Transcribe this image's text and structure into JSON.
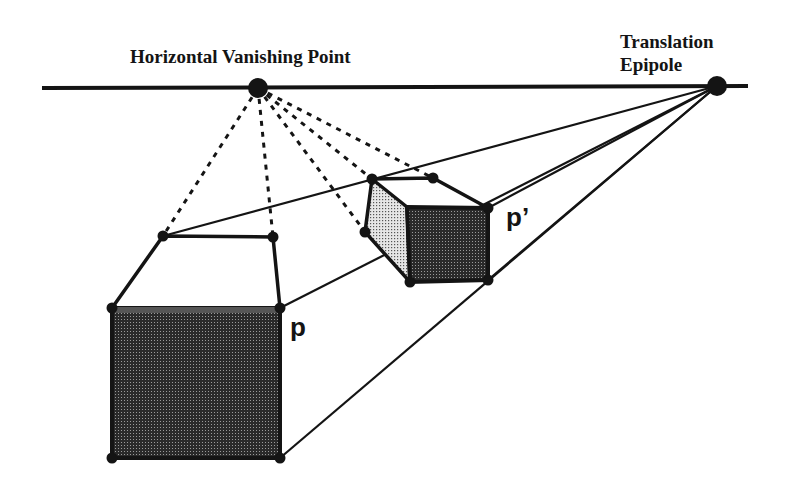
{
  "labels": {
    "vanishing_point": "Horizontal Vanishing Point",
    "epipole_line1": "Translation",
    "epipole_line2": "Epipole",
    "point_p": "p",
    "point_p_prime": "p’"
  },
  "colors": {
    "ink": "#141414",
    "dark_fill": "#3a3a3a",
    "light_fill": "#c8c8c8",
    "background": "#ffffff"
  },
  "geometry": {
    "horizon": {
      "x1": 42,
      "y1": 88,
      "x2": 748,
      "y2": 86
    },
    "vanishing_point": {
      "x": 258,
      "y": 88
    },
    "epipole": {
      "x": 717,
      "y": 86
    },
    "large_box": {
      "front_face": {
        "x": 112,
        "y": 308,
        "w": 168,
        "h": 150
      },
      "top_back_left": {
        "x": 163,
        "y": 236
      },
      "top_back_right": {
        "x": 273,
        "y": 237
      }
    },
    "small_box": {
      "top_back_left": {
        "x": 372,
        "y": 179
      },
      "top_back_right": {
        "x": 433,
        "y": 178
      },
      "front_top_right": {
        "x": 488,
        "y": 208
      },
      "front_top_left": {
        "x": 407,
        "y": 207
      },
      "back_bottom_left": {
        "x": 365,
        "y": 232
      },
      "front_bottom_left": {
        "x": 410,
        "y": 282
      },
      "front_bottom_right": {
        "x": 488,
        "y": 280
      }
    }
  }
}
